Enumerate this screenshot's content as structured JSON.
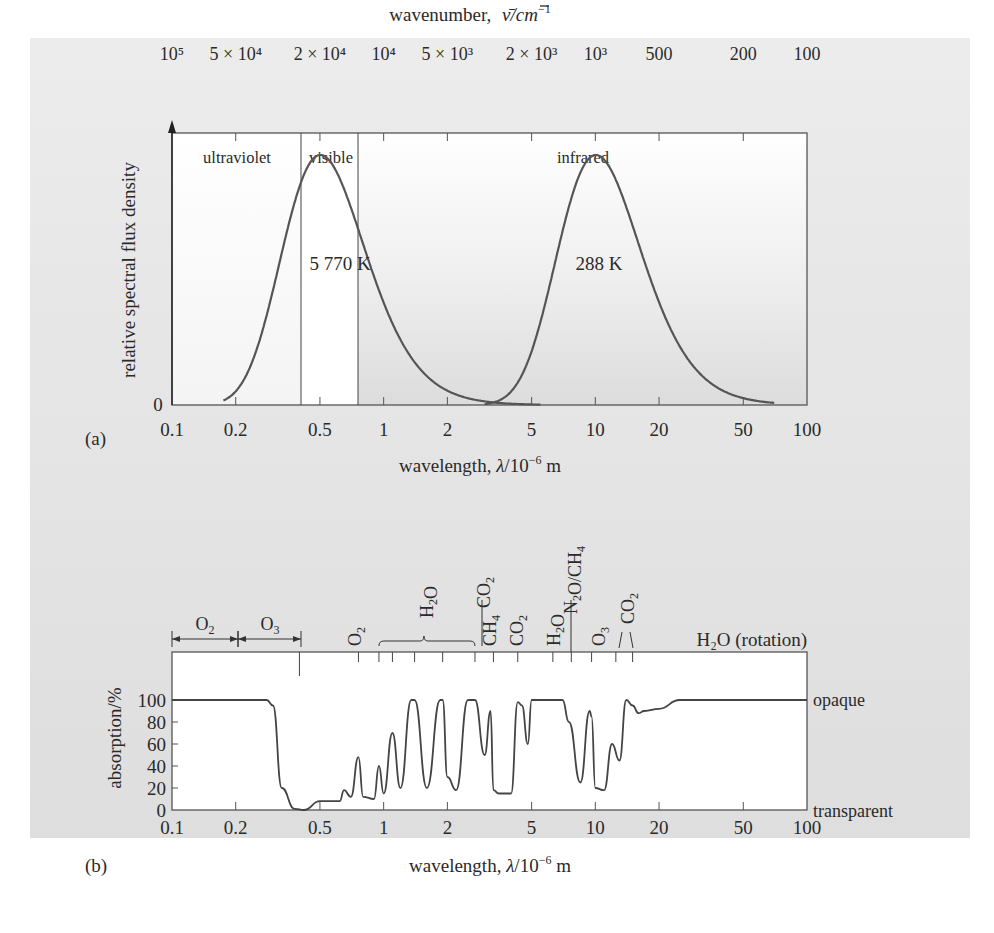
{
  "chart_data": [
    {
      "panel": "(a)",
      "type": "line",
      "title": "",
      "xlabel": "wavelength, λ/10⁻⁶ m",
      "ylabel": "relative spectral flux density",
      "x_scale": "log",
      "xlim": [
        0.1,
        100
      ],
      "x_ticks": [
        "0.1",
        "0.2",
        "0.5",
        "1",
        "2",
        "5",
        "10",
        "20",
        "50",
        "100"
      ],
      "y_ticks": [
        "0"
      ],
      "top_axis": {
        "label": "wavenumber, ν̄/cm⁻¹",
        "ticks": [
          "10⁵",
          "5 × 10⁴",
          "2 × 10⁴",
          "10⁴",
          "5 × 10³",
          "2 × 10³",
          "10³",
          "500",
          "200",
          "100"
        ]
      },
      "regions": [
        {
          "label": "ultraviolet",
          "from": 0.1,
          "to": 0.4
        },
        {
          "label": "visible",
          "from": 0.4,
          "to": 0.75
        },
        {
          "label": "infrared",
          "from": 0.75,
          "to": 100
        }
      ],
      "series": [
        {
          "name": "5 770 K",
          "peak_wavelength": 0.55,
          "x": [
            0.18,
            0.2,
            0.3,
            0.4,
            0.5,
            0.55,
            0.6,
            0.75,
            1,
            1.5,
            2,
            3,
            4,
            5
          ],
          "values": [
            0,
            0.02,
            0.35,
            0.78,
            0.97,
            1.0,
            0.99,
            0.9,
            0.65,
            0.35,
            0.2,
            0.07,
            0.02,
            0
          ]
        },
        {
          "name": "288 K",
          "peak_wavelength": 10,
          "x": [
            3,
            4,
            5,
            6,
            8,
            10,
            12,
            15,
            20,
            30,
            50,
            70
          ],
          "values": [
            0,
            0.07,
            0.25,
            0.5,
            0.87,
            1.0,
            0.95,
            0.78,
            0.5,
            0.22,
            0.06,
            0.01
          ]
        }
      ],
      "annotations": [
        "5 770 K",
        "288 K",
        "ultraviolet",
        "visible",
        "infrared"
      ],
      "grid": false,
      "legend": "none"
    },
    {
      "panel": "(b)",
      "type": "line",
      "title": "",
      "xlabel": "wavelength, λ/10⁻⁶ m",
      "ylabel": "absorption/%",
      "x_scale": "log",
      "xlim": [
        0.1,
        100
      ],
      "ylim": [
        0,
        100
      ],
      "x_ticks": [
        "0.1",
        "0.2",
        "0.5",
        "1",
        "2",
        "5",
        "10",
        "20",
        "50",
        "100"
      ],
      "y_ticks": [
        "0",
        "20",
        "40",
        "60",
        "80",
        "100"
      ],
      "right_labels": {
        "top": "opaque",
        "bottom": "transparent"
      },
      "absorbers": [
        "O₂",
        "O₃",
        "O₂",
        "H₂O",
        "CO₂",
        "CH₄",
        "CO₂",
        "H₂O",
        "N₂O/CH₄",
        "O₃",
        "CO₂",
        "H₂O (rotation)"
      ],
      "series": [
        {
          "name": "atmospheric absorption",
          "x": [
            0.1,
            0.28,
            0.3,
            0.33,
            0.38,
            0.42,
            0.5,
            0.62,
            0.65,
            0.7,
            0.76,
            0.8,
            0.9,
            0.95,
            1.0,
            1.1,
            1.2,
            1.35,
            1.4,
            1.6,
            1.85,
            1.9,
            2.0,
            2.2,
            2.5,
            2.7,
            3.0,
            3.2,
            3.3,
            3.5,
            4.0,
            4.3,
            4.5,
            4.8,
            5.0,
            5.5,
            7.0,
            7.5,
            8.5,
            9.4,
            9.6,
            10,
            11,
            12,
            13,
            14,
            15,
            16,
            17,
            20,
            25,
            100
          ],
          "values": [
            100,
            100,
            95,
            20,
            1,
            0,
            8,
            8,
            18,
            12,
            48,
            12,
            10,
            40,
            15,
            70,
            20,
            100,
            100,
            20,
            100,
            100,
            30,
            18,
            100,
            100,
            50,
            90,
            18,
            15,
            15,
            98,
            95,
            60,
            100,
            100,
            100,
            80,
            25,
            90,
            85,
            20,
            18,
            60,
            45,
            100,
            95,
            88,
            90,
            92,
            100,
            100
          ]
        }
      ],
      "grid": false,
      "legend": "none"
    }
  ],
  "figure": {
    "panel_a_label": "(a)",
    "panel_b_label": "(b)",
    "a": {
      "top_axis_title": "wavenumber,",
      "top_axis_unit": "ν̄/cm",
      "top_axis_exp": "−1",
      "ylabel": "relative spectral flux density",
      "y_zero": "0",
      "xlabel_prefix": "wavelength, ",
      "xlabel_lambda": "λ",
      "xlabel_unit": "/10",
      "xlabel_exp": "−6",
      "xlabel_m": " m",
      "region_uv": "ultraviolet",
      "region_vis": "visible",
      "region_ir": "infrared",
      "sun_label": "5 770 K",
      "earth_label": "288 K"
    },
    "b": {
      "ylabel": "absorption/%",
      "opaque": "opaque",
      "transparent": "transparent",
      "h2o_rotation": "H₂O (rotation)"
    }
  }
}
